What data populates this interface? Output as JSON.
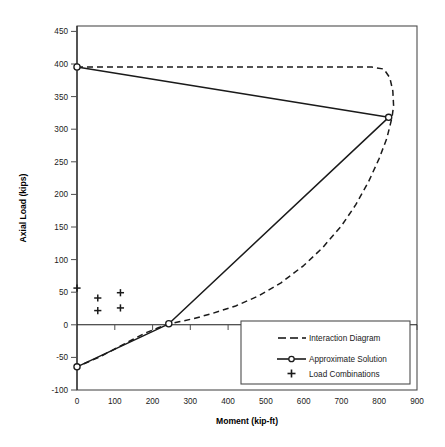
{
  "chart_data": {
    "type": "line",
    "title": "",
    "xlabel": "Moment (kip-ft)",
    "ylabel": "Axial Load (kips)",
    "xlim": [
      0,
      900
    ],
    "ylim": [
      -100,
      450
    ],
    "xticks": [
      0,
      100,
      200,
      300,
      400,
      500,
      600,
      700,
      800,
      900
    ],
    "yticks": [
      -100,
      -50,
      0,
      50,
      100,
      150,
      200,
      250,
      300,
      350,
      400,
      450
    ],
    "xtick_labels": [
      "0",
      "100",
      "200",
      "300",
      "400",
      "500",
      "600",
      "700",
      "800",
      "900"
    ],
    "ytick_labels": [
      "-100",
      "-50",
      "0",
      "50",
      "100",
      "150",
      "200",
      "250",
      "300",
      "350",
      "400",
      "450"
    ],
    "grid": false,
    "legend_position": "lower-right",
    "series": [
      {
        "name": "Interaction Diagram",
        "style": "dashed",
        "marker": "none",
        "color": "#1a1a1a",
        "points": [
          [
            0,
            388
          ],
          [
            100,
            388
          ],
          [
            200,
            388
          ],
          [
            300,
            388
          ],
          [
            400,
            388
          ],
          [
            500,
            388
          ],
          [
            600,
            388
          ],
          [
            700,
            388
          ],
          [
            780,
            388
          ],
          [
            812,
            385
          ],
          [
            828,
            372
          ],
          [
            836,
            352
          ],
          [
            838,
            330
          ],
          [
            834,
            312
          ],
          [
            820,
            280
          ],
          [
            800,
            250
          ],
          [
            772,
            215
          ],
          [
            738,
            180
          ],
          [
            700,
            148
          ],
          [
            650,
            115
          ],
          [
            600,
            88
          ],
          [
            540,
            62
          ],
          [
            480,
            42
          ],
          [
            420,
            27
          ],
          [
            360,
            16
          ],
          [
            310,
            8
          ],
          [
            270,
            3
          ],
          [
            245,
            0
          ],
          [
            215,
            -6
          ],
          [
            180,
            -14
          ],
          [
            140,
            -26
          ],
          [
            100,
            -38
          ],
          [
            60,
            -50
          ],
          [
            20,
            -60
          ],
          [
            0,
            -65
          ]
        ]
      },
      {
        "name": "Approximate Solution",
        "style": "solid",
        "marker": "circle",
        "color": "#1a1a1a",
        "points": [
          [
            0,
            388
          ],
          [
            825,
            312
          ],
          [
            243,
            0
          ],
          [
            0,
            -65
          ]
        ],
        "marker_points": [
          [
            0,
            388
          ],
          [
            825,
            312
          ],
          [
            243,
            0
          ],
          [
            0,
            -65
          ]
        ]
      },
      {
        "name": "Load Combinations",
        "style": "none",
        "marker": "plus",
        "color": "#1a1a1a",
        "points": [
          [
            0,
            54
          ],
          [
            55,
            39
          ],
          [
            55,
            20
          ],
          [
            115,
            47
          ],
          [
            115,
            24
          ]
        ]
      }
    ],
    "legend": [
      {
        "label": "Interaction Diagram",
        "style": "dashed",
        "marker": "none"
      },
      {
        "label": "Approximate Solution",
        "style": "solid",
        "marker": "circle"
      },
      {
        "label": "Load Combinations",
        "style": "none",
        "marker": "plus"
      }
    ],
    "colors": {
      "line": "#1a1a1a",
      "frame": "#4d4d4d",
      "background": "#ffffff"
    }
  }
}
